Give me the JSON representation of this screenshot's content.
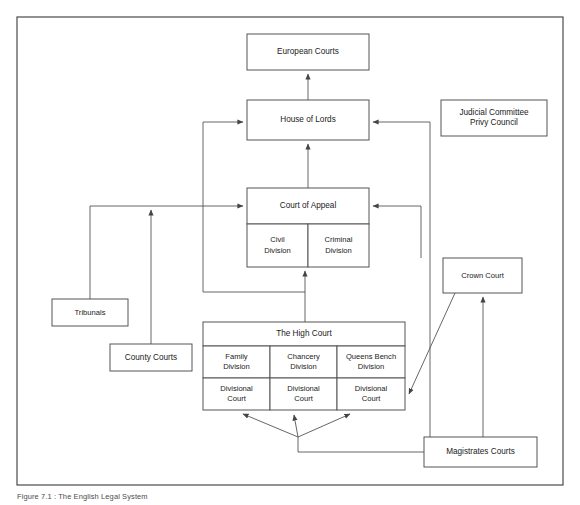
{
  "figure": {
    "caption": "Figure 7.1  :  The English Legal System",
    "frame": {
      "x": 17,
      "y": 17,
      "width": 546,
      "height": 468
    }
  },
  "theme": {
    "background": "#ffffff",
    "box_fill": "#ffffff",
    "box_stroke": "#555555",
    "frame_stroke": "#4a4a4a",
    "line_color": "#555555",
    "text_color": "#1a1a1a"
  },
  "nodes": [
    {
      "id": "european-courts",
      "label": "European Courts",
      "box": {
        "x": 247,
        "y": 34,
        "width": 122,
        "height": 36
      },
      "lines": [
        "European Courts"
      ]
    },
    {
      "id": "house-of-lords",
      "label": "House of Lords",
      "box": {
        "x": 247,
        "y": 100,
        "width": 122,
        "height": 40
      },
      "lines": [
        "House of Lords"
      ]
    },
    {
      "id": "judicial-committee-privy-council",
      "label": "Judicial Committee Privy Council",
      "box": {
        "x": 441,
        "y": 100,
        "width": 106,
        "height": 36
      },
      "lines": [
        "Judicial Committee",
        "Privy Council"
      ]
    },
    {
      "id": "court-of-appeal",
      "label": "Court of Appeal",
      "box": {
        "x": 247,
        "y": 188,
        "width": 122,
        "height": 36
      },
      "lines": [
        "Court of Appeal"
      ]
    },
    {
      "id": "civil-division",
      "label": "Civil Division",
      "box": {
        "x": 247,
        "y": 224,
        "width": 61,
        "height": 43
      },
      "lines": [
        "Civil",
        "Division"
      ]
    },
    {
      "id": "criminal-division",
      "label": "Criminal Division",
      "box": {
        "x": 308,
        "y": 224,
        "width": 61,
        "height": 43
      },
      "lines": [
        "Criminal",
        "Division"
      ]
    },
    {
      "id": "crown-court",
      "label": "Crown Court",
      "box": {
        "x": 443,
        "y": 258,
        "width": 79,
        "height": 35
      },
      "lines": [
        "Crown Court"
      ]
    },
    {
      "id": "tribunals",
      "label": "Tribunals",
      "box": {
        "x": 52,
        "y": 299,
        "width": 76,
        "height": 27
      },
      "lines": [
        "Tribunals"
      ]
    },
    {
      "id": "county-courts",
      "label": "County Courts",
      "box": {
        "x": 110,
        "y": 344,
        "width": 82,
        "height": 27
      },
      "lines": [
        "County Courts"
      ]
    },
    {
      "id": "the-high-court",
      "label": "The High Court",
      "box": {
        "x": 203,
        "y": 322,
        "width": 202,
        "height": 24
      },
      "lines": [
        "The High Court"
      ]
    },
    {
      "id": "family-division",
      "label": "Family Division",
      "box": {
        "x": 203,
        "y": 346,
        "width": 67,
        "height": 32
      },
      "lines": [
        "Family",
        "Division"
      ]
    },
    {
      "id": "chancery-division",
      "label": "Chancery Division",
      "box": {
        "x": 270,
        "y": 346,
        "width": 67,
        "height": 32
      },
      "lines": [
        "Chancery",
        "Division"
      ]
    },
    {
      "id": "queens-bench-division",
      "label": "Queens Bench Division",
      "box": {
        "x": 337,
        "y": 346,
        "width": 68,
        "height": 32
      },
      "lines": [
        "Queens Bench",
        "Division"
      ]
    },
    {
      "id": "divisional-court-family",
      "label": "Divisional Court",
      "box": {
        "x": 203,
        "y": 378,
        "width": 67,
        "height": 32
      },
      "lines": [
        "Divisional",
        "Court"
      ]
    },
    {
      "id": "divisional-court-chancery",
      "label": "Divisional Court",
      "box": {
        "x": 270,
        "y": 378,
        "width": 67,
        "height": 32
      },
      "lines": [
        "Divisional",
        "Court"
      ]
    },
    {
      "id": "divisional-court-queens-bench",
      "label": "Divisional Court",
      "box": {
        "x": 337,
        "y": 378,
        "width": 68,
        "height": 32
      },
      "lines": [
        "Divisional",
        "Court"
      ]
    },
    {
      "id": "magistrates-courts",
      "label": "Magistrates Courts",
      "box": {
        "x": 424,
        "y": 437,
        "width": 113,
        "height": 30
      },
      "lines": [
        "Magistrates Courts"
      ]
    }
  ],
  "connections": [
    {
      "id": "house-of-lords-to-european-courts",
      "from": "house-of-lords",
      "to": "european-courts",
      "path": "M 308 100 L 308 74",
      "arrow_at": {
        "x": 308,
        "y": 70
      }
    },
    {
      "id": "court-of-appeal-to-house-of-lords",
      "from": "court-of-appeal",
      "to": "house-of-lords",
      "path": "M 308 188 L 308 144",
      "arrow_at": {
        "x": 308,
        "y": 140
      }
    },
    {
      "id": "high-court-to-court-of-appeal",
      "from": "the-high-court",
      "to": "court-of-appeal",
      "path": "M 305 322 L 305 271",
      "arrow_at": {
        "x": 305,
        "y": 267
      }
    },
    {
      "id": "high-court-to-house-of-lords-leapfrog",
      "from": "the-high-court",
      "to": "house-of-lords",
      "path": "M 305 292 L 203 292 L 203 122 L 243 122",
      "arrow_at": {
        "x": 247,
        "y": 122
      }
    },
    {
      "id": "tribunals-to-court-of-appeal",
      "from": "tribunals",
      "to": "court-of-appeal",
      "path": "M 90 299 L 90 206 L 243 206",
      "arrow_at": {
        "x": 247,
        "y": 206
      }
    },
    {
      "id": "county-courts-to-court-of-appeal",
      "from": "county-courts",
      "to": "court-of-appeal",
      "path": "M 151 344 L 151 210",
      "arrow_at": {
        "x": 151,
        "y": 206
      }
    },
    {
      "id": "crown-court-to-court-of-appeal",
      "from": "crown-court",
      "to": "court-of-appeal",
      "path": "M 421 258 L 421 206 L 373 206",
      "arrow_at": {
        "x": 369,
        "y": 206
      }
    },
    {
      "id": "magistrates-to-house-of-lords",
      "from": "magistrates-courts",
      "to": "house-of-lords",
      "path": "M 430 452 L 430 122 L 373 122",
      "arrow_at": {
        "x": 369,
        "y": 122
      }
    },
    {
      "id": "magistrates-to-crown-court",
      "from": "magistrates-courts",
      "to": "crown-court",
      "path": "M 483 437 L 483 297",
      "arrow_at": {
        "x": 483,
        "y": 293
      }
    },
    {
      "id": "crown-court-to-queens-bench-divisional-court",
      "from": "crown-court",
      "to": "divisional-court-queens-bench",
      "path": "M 455 293 L 409 394",
      "arrow_at": {
        "x": 406,
        "y": 399
      }
    },
    {
      "id": "magistrates-fanout-trunk",
      "from": "magistrates-courts",
      "to": "divisional-courts",
      "path": "M 424 452 L 298 452 L 298 437",
      "arrow_at": null
    },
    {
      "id": "fanout-to-divisional-court-family",
      "from": "magistrates-courts",
      "to": "divisional-court-family",
      "path": "M 298 437 L 243 414",
      "arrow_at": {
        "x": 239,
        "y": 412
      }
    },
    {
      "id": "fanout-to-divisional-court-chancery",
      "from": "magistrates-courts",
      "to": "divisional-court-chancery",
      "path": "M 298 437 L 294 415",
      "arrow_at": {
        "x": 293,
        "y": 411
      }
    },
    {
      "id": "fanout-to-divisional-court-queens-bench",
      "from": "magistrates-courts",
      "to": "divisional-court-queens-bench",
      "path": "M 298 437 L 350 414",
      "arrow_at": {
        "x": 354,
        "y": 412
      }
    }
  ]
}
